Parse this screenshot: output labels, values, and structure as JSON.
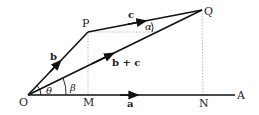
{
  "diagram": {
    "type": "vector-addition",
    "points": {
      "O": {
        "label": "O",
        "x": 28,
        "y": 95
      },
      "P": {
        "label": "P",
        "x": 88,
        "y": 32
      },
      "Q": {
        "label": "Q",
        "x": 202,
        "y": 10
      },
      "M": {
        "label": "M",
        "x": 88,
        "y": 95
      },
      "N": {
        "label": "N",
        "x": 203,
        "y": 95
      },
      "A": {
        "label": "A",
        "x": 235,
        "y": 95
      }
    },
    "vectors": {
      "a": {
        "label": "a"
      },
      "b": {
        "label": "b"
      },
      "c": {
        "label": "c"
      },
      "sum": {
        "label": "b + c"
      }
    },
    "angles": {
      "theta": {
        "label": "θ"
      },
      "beta": {
        "label": "β"
      },
      "alpha": {
        "label": "α"
      }
    },
    "colors": {
      "line": "#111111",
      "dotted": "#bbbbbb"
    }
  }
}
